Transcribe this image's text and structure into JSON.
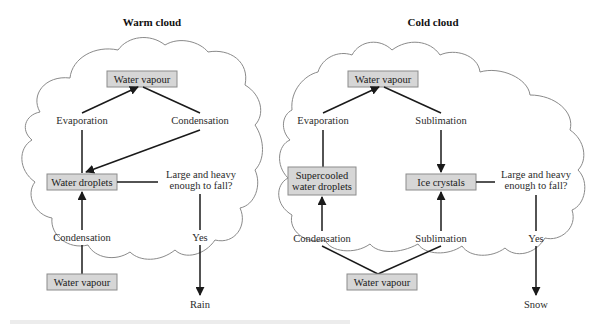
{
  "warm": {
    "title": "Warm cloud",
    "top_vapour": "Water vapour",
    "evaporation": "Evaporation",
    "condensation_top": "Condensation",
    "droplets": "Water droplets",
    "question_line1": "Large and heavy",
    "question_line2": "enough to fall?",
    "condensation_bottom": "Condensation",
    "yes": "Yes",
    "bottom_vapour": "Water vapour",
    "outcome": "Rain"
  },
  "cold": {
    "title": "Cold cloud",
    "top_vapour": "Water vapour",
    "evaporation": "Evaporation",
    "sublimation_top": "Sublimation",
    "supercooled_line1": "Supercooled",
    "supercooled_line2": "water droplets",
    "ice": "Ice crystals",
    "question_line1": "Large and heavy",
    "question_line2": "enough to fall?",
    "condensation_bottom": "Condensation",
    "sublimation_bottom": "Sublimation",
    "yes": "Yes",
    "bottom_vapour": "Water vapour",
    "outcome": "Snow"
  },
  "colors": {
    "box_fill": "#d6d6d6",
    "box_stroke": "#8c8c8c",
    "cloud_stroke": "#8a8a8a",
    "arrow": "#1a1a1a"
  }
}
